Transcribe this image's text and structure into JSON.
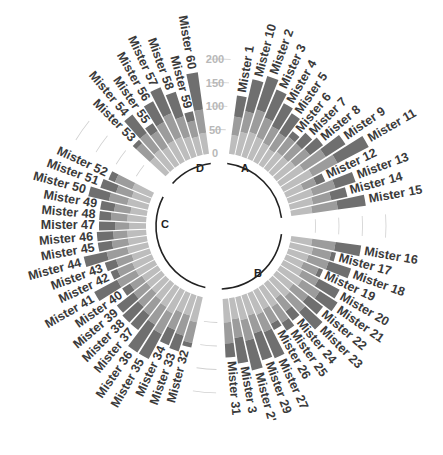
{
  "chart_data": {
    "type": "bar",
    "subtype": "circular-stacked-bar",
    "title": "",
    "colors": [
      "#bdbdbd",
      "#9c9c9c",
      "#6f6f6f"
    ],
    "scale_ticks": [
      0,
      50,
      100,
      150,
      200
    ],
    "ylim": [
      0,
      200
    ],
    "groups": [
      "A",
      "B",
      "C",
      "D"
    ],
    "order": [
      {
        "name": "Mister 1",
        "group": "A",
        "values": [
          40,
          40,
          45
        ]
      },
      {
        "name": "Mister 10",
        "group": "A",
        "values": [
          50,
          45,
          70
        ]
      },
      {
        "name": "Mister 2",
        "group": "A",
        "values": [
          55,
          50,
          75
        ]
      },
      {
        "name": "Mister 3",
        "group": "A",
        "values": [
          50,
          45,
          65
        ]
      },
      {
        "name": "Mister 4",
        "group": "A",
        "values": [
          45,
          40,
          55
        ]
      },
      {
        "name": "Mister 5",
        "group": "A",
        "values": [
          40,
          40,
          50
        ]
      },
      {
        "name": "Mister 6",
        "group": "A",
        "values": [
          45,
          40,
          15
        ]
      },
      {
        "name": "Mister 7",
        "group": "A",
        "values": [
          45,
          40,
          30
        ]
      },
      {
        "name": "Mister 8",
        "group": "A",
        "values": [
          50,
          40,
          35
        ]
      },
      {
        "name": "Mister 9",
        "group": "A",
        "values": [
          60,
          55,
          50
        ]
      },
      {
        "name": "Mister 11",
        "group": "A",
        "values": [
          70,
          60,
          75
        ]
      },
      {
        "name": "Mister 12",
        "group": "A",
        "values": [
          40,
          30,
          20
        ]
      },
      {
        "name": "Mister 13",
        "group": "A",
        "values": [
          55,
          50,
          45
        ]
      },
      {
        "name": "Mister 14",
        "group": "A",
        "values": [
          50,
          40,
          35
        ]
      },
      {
        "name": "Mister 15",
        "group": "A",
        "values": [
          45,
          55,
          60
        ]
      },
      {
        "name": "Mister 16",
        "group": "B",
        "values": [
          45,
          50,
          55
        ]
      },
      {
        "name": "Mister 17",
        "group": "B",
        "values": [
          50,
          40,
          10
        ]
      },
      {
        "name": "Mister 18",
        "group": "B",
        "values": [
          45,
          45,
          50
        ]
      },
      {
        "name": "Mister 19",
        "group": "B",
        "values": [
          40,
          35,
          10
        ]
      },
      {
        "name": "Mister 20",
        "group": "B",
        "values": [
          45,
          40,
          50
        ]
      },
      {
        "name": "Mister 21",
        "group": "B",
        "values": [
          55,
          45,
          45
        ]
      },
      {
        "name": "Mister 22",
        "group": "B",
        "values": [
          45,
          40,
          40
        ]
      },
      {
        "name": "Mister 23",
        "group": "B",
        "values": [
          50,
          45,
          50
        ]
      },
      {
        "name": "Mister 24",
        "group": "B",
        "values": [
          40,
          35,
          25
        ]
      },
      {
        "name": "Mister 25",
        "group": "B",
        "values": [
          50,
          40,
          20
        ]
      },
      {
        "name": "Mister 26",
        "group": "B",
        "values": [
          45,
          35,
          15
        ]
      },
      {
        "name": "Mister 27",
        "group": "B",
        "values": [
          50,
          40,
          60
        ]
      },
      {
        "name": "Mister 29",
        "group": "B",
        "values": [
          45,
          40,
          60
        ]
      },
      {
        "name": "Mister 2'",
        "group": "B",
        "values": [
          50,
          45,
          65
        ]
      },
      {
        "name": "Mister 3",
        "group": "B",
        "values": [
          45,
          40,
          55
        ]
      },
      {
        "name": "Mister 31",
        "group": "B",
        "values": [
          50,
          45,
          30
        ]
      },
      {
        "name": "Mister 32",
        "group": "C",
        "values": [
          55,
          45,
          10
        ]
      },
      {
        "name": "Mister 33",
        "group": "C",
        "values": [
          45,
          45,
          35
        ]
      },
      {
        "name": "Mister 34",
        "group": "C",
        "values": [
          45,
          40,
          35
        ]
      },
      {
        "name": "Mister 35",
        "group": "C",
        "values": [
          55,
          50,
          60
        ]
      },
      {
        "name": "Mister 36",
        "group": "C",
        "values": [
          50,
          45,
          70
        ]
      },
      {
        "name": "Mister 37",
        "group": "C",
        "values": [
          45,
          40,
          40
        ]
      },
      {
        "name": "Mister 38",
        "group": "C",
        "values": [
          40,
          40,
          45
        ]
      },
      {
        "name": "Mister 39",
        "group": "C",
        "values": [
          40,
          35,
          45
        ]
      },
      {
        "name": "Mister 40",
        "group": "C",
        "values": [
          40,
          30,
          20
        ]
      },
      {
        "name": "Mister 41",
        "group": "C",
        "values": [
          45,
          45,
          55
        ]
      },
      {
        "name": "Mister 42",
        "group": "C",
        "values": [
          45,
          35,
          15
        ]
      },
      {
        "name": "Mister 43",
        "group": "C",
        "values": [
          40,
          35,
          25
        ]
      },
      {
        "name": "Mister 44",
        "group": "C",
        "values": [
          45,
          45,
          50
        ]
      },
      {
        "name": "Mister 45",
        "group": "C",
        "values": [
          40,
          35,
          30
        ]
      },
      {
        "name": "Mister 46",
        "group": "C",
        "values": [
          40,
          30,
          35
        ]
      },
      {
        "name": "Mister 47",
        "group": "C",
        "values": [
          35,
          30,
          35
        ]
      },
      {
        "name": "Mister 48",
        "group": "C",
        "values": [
          40,
          35,
          25
        ]
      },
      {
        "name": "Mister 49",
        "group": "C",
        "values": [
          35,
          35,
          30
        ]
      },
      {
        "name": "Mister 50",
        "group": "C",
        "values": [
          45,
          40,
          45
        ]
      },
      {
        "name": "Mister 51",
        "group": "C",
        "values": [
          40,
          35,
          35
        ]
      },
      {
        "name": "Mister 52",
        "group": "C",
        "values": [
          45,
          40,
          15
        ]
      },
      {
        "name": "Mister 53",
        "group": "D",
        "values": [
          45,
          40,
          10
        ]
      },
      {
        "name": "Mister 54",
        "group": "D",
        "values": [
          50,
          45,
          50
        ]
      },
      {
        "name": "Mister 55",
        "group": "D",
        "values": [
          45,
          40,
          20
        ]
      },
      {
        "name": "Mister 56",
        "group": "D",
        "values": [
          50,
          45,
          50
        ]
      },
      {
        "name": "Mister 57",
        "group": "D",
        "values": [
          50,
          55,
          60
        ]
      },
      {
        "name": "Mister 58",
        "group": "D",
        "values": [
          45,
          45,
          55
        ]
      },
      {
        "name": "Mister 59",
        "group": "D",
        "values": [
          40,
          35,
          20
        ]
      },
      {
        "name": "Mister 60",
        "group": "D",
        "values": [
          45,
          50,
          80
        ]
      }
    ]
  },
  "layout": {
    "cx": 219,
    "cy": 226,
    "inner_radius": 63,
    "zero_radius": 73,
    "px_per_unit": 0.47,
    "slot_deg": 5,
    "gap_slots": 3,
    "group_sizes": [
      15,
      16,
      21,
      8
    ],
    "group_label_positions": [
      {
        "label": "A",
        "x": 245,
        "y": 172
      },
      {
        "label": "B",
        "x": 258,
        "y": 277
      },
      {
        "label": "C",
        "x": 165,
        "y": 228
      },
      {
        "label": "D",
        "x": 200,
        "y": 172
      }
    ]
  }
}
